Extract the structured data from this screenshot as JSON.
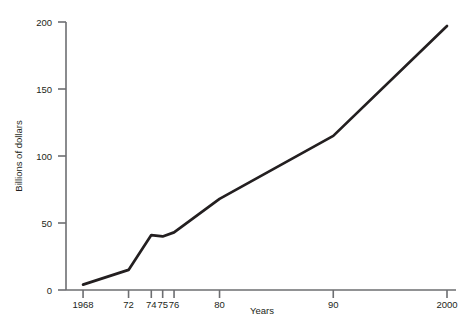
{
  "chart_data": {
    "type": "line",
    "title": "",
    "xlabel": "Years",
    "ylabel": "Billions of dollars",
    "x": [
      1968,
      1972,
      1974,
      1975,
      1976,
      1980,
      1990,
      2000
    ],
    "values": [
      4,
      15,
      41,
      40,
      43,
      68,
      115,
      197
    ],
    "series": [
      {
        "name": "Billions of dollars",
        "values": [
          4,
          15,
          41,
          40,
          43,
          68,
          115,
          197
        ]
      }
    ],
    "x_tick_labels": [
      "1968",
      "72",
      "74",
      "75",
      "76",
      "80",
      "90",
      "2000"
    ],
    "x_tick_positions": [
      1968,
      1972,
      1974,
      1975,
      1976,
      1980,
      1990,
      2000
    ],
    "y_tick_labels": [
      "0",
      "50",
      "100",
      "150",
      "200"
    ],
    "y_tick_values": [
      0,
      50,
      100,
      150,
      200
    ],
    "xlim": [
      1966.5,
      2000
    ],
    "ylim": [
      0,
      200
    ],
    "grid": false,
    "legend": false,
    "line_color": "#231f20",
    "axis_color": "#6d6e71"
  },
  "caption": {
    "text": ""
  }
}
